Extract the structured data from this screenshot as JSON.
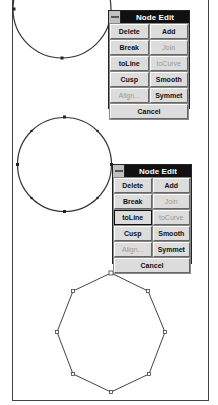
{
  "panels": [
    {
      "title": "Node Edit",
      "buttons": [
        {
          "label": "Delete",
          "disabled": false
        },
        {
          "label": "Add",
          "disabled": false
        },
        {
          "label": "Break",
          "disabled": false
        },
        {
          "label": "Join",
          "disabled": true
        },
        {
          "label": "toLine",
          "disabled": false
        },
        {
          "label": "toCurve",
          "disabled": true
        },
        {
          "label": "Cusp",
          "disabled": false
        },
        {
          "label": "Smooth",
          "disabled": false
        },
        {
          "label": "Align...",
          "disabled": true
        },
        {
          "label": "Symmet",
          "disabled": false
        },
        {
          "label": "Cancel",
          "disabled": false
        }
      ]
    },
    {
      "title": "Node Edit",
      "buttons": [
        {
          "label": "Delete",
          "disabled": false
        },
        {
          "label": "Add",
          "disabled": false
        },
        {
          "label": "Break",
          "disabled": false
        },
        {
          "label": "Join",
          "disabled": true
        },
        {
          "label": "toLine",
          "disabled": false,
          "pressed": true
        },
        {
          "label": "toCurve",
          "disabled": true
        },
        {
          "label": "Cusp",
          "disabled": false
        },
        {
          "label": "Smooth",
          "disabled": false
        },
        {
          "label": "Align...",
          "disabled": true
        },
        {
          "label": "Symmet",
          "disabled": false
        },
        {
          "label": "Cancel",
          "disabled": false
        }
      ]
    }
  ],
  "colors": {
    "titlebar": "#111111",
    "button_face": "#dcdcdc",
    "disabled_text": "#9a9a9a"
  }
}
